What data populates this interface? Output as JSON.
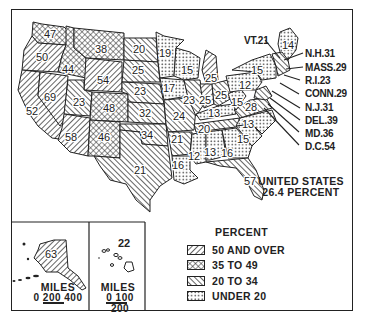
{
  "map": {
    "title": "",
    "total": {
      "line1": "UNITED STATES",
      "line2": "26.4 PERCENT"
    },
    "legend": {
      "title": "PERCENT",
      "items": [
        {
          "label": "50 AND OVER",
          "pattern": "fwd-hatch"
        },
        {
          "label": "35 TO 49",
          "pattern": "crosshatch"
        },
        {
          "label": "20 TO 34",
          "pattern": "back-hatch"
        },
        {
          "label": "UNDER 20",
          "pattern": "dots"
        }
      ]
    },
    "states": [
      {
        "name": "Washington",
        "value": "47"
      },
      {
        "name": "Oregon",
        "value": "50"
      },
      {
        "name": "California",
        "value": "52"
      },
      {
        "name": "Nevada",
        "value": "69"
      },
      {
        "name": "Idaho",
        "value": "44"
      },
      {
        "name": "Montana",
        "value": "38"
      },
      {
        "name": "Wyoming",
        "value": "54"
      },
      {
        "name": "Utah",
        "value": "23"
      },
      {
        "name": "Colorado",
        "value": "48"
      },
      {
        "name": "Arizona",
        "value": "58"
      },
      {
        "name": "New Mexico",
        "value": "46"
      },
      {
        "name": "North Dakota",
        "value": "20"
      },
      {
        "name": "South Dakota",
        "value": "25"
      },
      {
        "name": "Nebraska",
        "value": "23"
      },
      {
        "name": "Kansas",
        "value": "32"
      },
      {
        "name": "Oklahoma",
        "value": "34"
      },
      {
        "name": "Texas",
        "value": "21"
      },
      {
        "name": "Minnesota",
        "value": "19"
      },
      {
        "name": "Iowa",
        "value": "17"
      },
      {
        "name": "Missouri",
        "value": "24"
      },
      {
        "name": "Arkansas",
        "value": "21"
      },
      {
        "name": "Louisiana",
        "value": "16"
      },
      {
        "name": "Wisconsin",
        "value": "15"
      },
      {
        "name": "Illinois",
        "value": "23"
      },
      {
        "name": "Michigan",
        "value": "25"
      },
      {
        "name": "Indiana",
        "value": "25"
      },
      {
        "name": "Ohio",
        "value": "25"
      },
      {
        "name": "Kentucky",
        "value": "13"
      },
      {
        "name": "Tennessee",
        "value": "20"
      },
      {
        "name": "Mississippi",
        "value": "12"
      },
      {
        "name": "Alabama",
        "value": "13"
      },
      {
        "name": "Georgia",
        "value": "16"
      },
      {
        "name": "Florida",
        "value": "57"
      },
      {
        "name": "South Carolina",
        "value": "15"
      },
      {
        "name": "North Carolina",
        "value": "13"
      },
      {
        "name": "Virginia",
        "value": "28"
      },
      {
        "name": "West Virginia",
        "value": "15"
      },
      {
        "name": "Pennsylvania",
        "value": "12"
      },
      {
        "name": "New York",
        "value": "15"
      },
      {
        "name": "Maine",
        "value": "14"
      },
      {
        "name": "Alaska",
        "value": "63"
      },
      {
        "name": "Hawaii",
        "value": "22"
      }
    ],
    "callouts": [
      {
        "label": "VT.21"
      },
      {
        "label": "N.H.31"
      },
      {
        "label": "MASS.29"
      },
      {
        "label": "R.I.23"
      },
      {
        "label": "CONN.29"
      },
      {
        "label": "N.J.31"
      },
      {
        "label": "DEL.39"
      },
      {
        "label": "MD.36"
      },
      {
        "label": "D.C.54"
      }
    ],
    "insets": {
      "alaska": {
        "value": "63",
        "scale_title": "MILES",
        "scale": "0 200 400"
      },
      "hawaii": {
        "value": "22",
        "scale_title": "MILES",
        "scale": "0 100 200"
      }
    },
    "colors": {
      "ink": "#222222",
      "paper": "#ffffff"
    }
  }
}
